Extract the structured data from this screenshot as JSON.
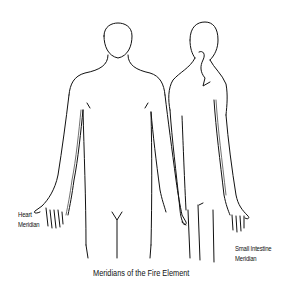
{
  "diagram": {
    "caption": "Meridians of the Fire Element",
    "figures": [
      {
        "view": "front",
        "label_line1": "Heart",
        "label_line2": "Meridian"
      },
      {
        "view": "back",
        "label_line1": "Small Intestine",
        "label_line2": "Meridian"
      }
    ],
    "colors": {
      "line": "#111111",
      "background": "#ffffff"
    }
  }
}
